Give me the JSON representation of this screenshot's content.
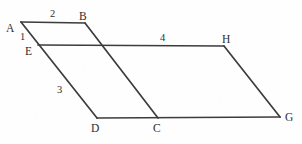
{
  "figure": {
    "background_color": "#fefefe",
    "stroke_color": "#3c3c3c",
    "text_color": "#2e2e2e",
    "width": 302,
    "height": 144,
    "vertices": [
      {
        "id": "A",
        "label": "A",
        "x": 21,
        "y": 22,
        "label_x": 6,
        "label_y": 23
      },
      {
        "id": "B",
        "label": "B",
        "x": 85,
        "y": 23,
        "label_x": 79,
        "label_y": 11
      },
      {
        "id": "E",
        "label": "E",
        "x": 38,
        "y": 45,
        "label_x": 25,
        "label_y": 46
      },
      {
        "id": "H",
        "label": "H",
        "x": 224,
        "y": 46,
        "label_x": 222,
        "label_y": 34
      },
      {
        "id": "D",
        "label": "D",
        "x": 97,
        "y": 118,
        "label_x": 91,
        "label_y": 123
      },
      {
        "id": "C",
        "label": "C",
        "x": 158,
        "y": 118,
        "label_x": 153,
        "label_y": 123
      },
      {
        "id": "G",
        "label": "G",
        "x": 280,
        "y": 117,
        "label_x": 285,
        "label_y": 112
      }
    ],
    "segments": [
      {
        "id": "AB",
        "from": "A",
        "to": "B"
      },
      {
        "id": "AD",
        "from": "A",
        "to": "D"
      },
      {
        "id": "EH",
        "from": "E",
        "to": "H"
      },
      {
        "id": "BC",
        "from": "B",
        "to": "C"
      },
      {
        "id": "DG",
        "from": "D",
        "to": "G"
      },
      {
        "id": "HG",
        "from": "H",
        "to": "G"
      }
    ],
    "segment_labels": [
      {
        "id": "label-2",
        "text": "2",
        "x": 50,
        "y": 9
      },
      {
        "id": "label-1",
        "text": "1",
        "x": 20,
        "y": 32
      },
      {
        "id": "label-4",
        "text": "4",
        "x": 160,
        "y": 33
      },
      {
        "id": "label-3",
        "text": "3",
        "x": 57,
        "y": 85
      }
    ]
  }
}
